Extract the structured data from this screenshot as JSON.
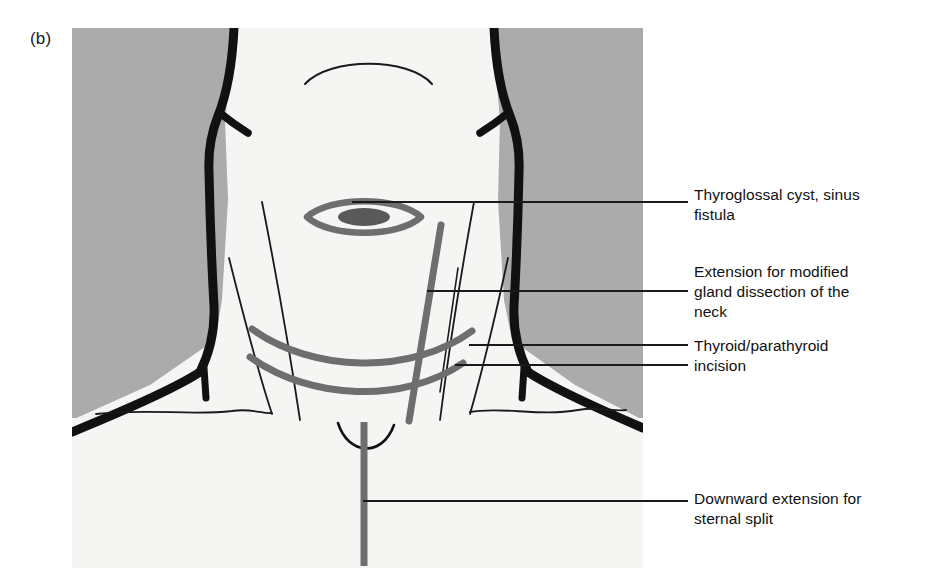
{
  "figure": {
    "panel_label": "(b)",
    "panel_bounds": {
      "x": 72,
      "y": 28,
      "width": 571,
      "height": 540
    },
    "colors": {
      "background_gray": "#ababab",
      "skin": "#f5f5f3",
      "outline_black": "#111111",
      "marking_gray": "#6e6e6e",
      "leader_line": "#1a1a1a",
      "text": "#111111"
    }
  },
  "callouts": [
    {
      "id": "thyroglossal",
      "text": "Thyroglossal cyst, sinus\nfistula",
      "marking": "lens-shaped ellipse over midline of upper neck",
      "leader_from_x": 352,
      "leader_to_x": 688,
      "leader_y": 202
    },
    {
      "id": "extension",
      "text": "Extension for modified\ngland dissection of the\nneck",
      "marking": "oblique line crossing the lateral neck",
      "leader_from_x": 427,
      "leader_to_x": 688,
      "leader_y": 291
    },
    {
      "id": "thyroid",
      "text": "Thyroid/parathyroid\nincision",
      "marking": "two parallel transverse curved collar incisions",
      "leader_from_x": 469,
      "leader_to_x": 688,
      "leader_y": 345,
      "leader2_from_x": 455,
      "leader2_to_x": 688,
      "leader2_y": 365
    },
    {
      "id": "sternal",
      "text": "Downward extension for\nsternal split",
      "marking": "vertical midline line running down over the sternum",
      "leader_from_x": 363,
      "leader_to_x": 688,
      "leader_y": 501
    }
  ]
}
